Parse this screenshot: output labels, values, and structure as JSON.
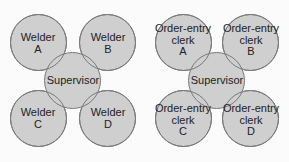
{
  "diagrams": [
    {
      "center": {
        "label": "Supervisor"
      },
      "nodes": [
        {
          "line1": "Welder",
          "line2": "A"
        },
        {
          "line1": "Welder",
          "line2": "B"
        },
        {
          "line1": "Welder",
          "line2": "C"
        },
        {
          "line1": "Welder",
          "line2": "D"
        }
      ]
    },
    {
      "center": {
        "label": "Supervisor"
      },
      "nodes": [
        {
          "line1": "Order-entry",
          "line2": "clerk",
          "line3": "A"
        },
        {
          "line1": "Order-entry",
          "line2": "clerk",
          "line3": "B"
        },
        {
          "line1": "Order-entry",
          "line2": "clerk",
          "line3": "C"
        },
        {
          "line1": "Order-entry",
          "line2": "clerk",
          "line3": "D"
        }
      ]
    }
  ],
  "colors": {
    "background": "#fbfbfb",
    "circle_fill": "#cfcfcf",
    "circle_stroke": "#7a7a7a",
    "text": "#222222"
  }
}
